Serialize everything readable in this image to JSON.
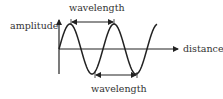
{
  "diagram": {
    "type": "wave-diagram",
    "labels": {
      "top_wavelength": "wavelength",
      "bottom_wavelength": "wavelength",
      "y_axis": "amplitude",
      "x_axis": "distance"
    },
    "colors": {
      "stroke": "#222222",
      "text": "#333333",
      "background": "#ffffff"
    },
    "wave": {
      "shape": "sine",
      "wavelength_px": 44,
      "amplitude_px": 25,
      "center_y": 49,
      "start_x": 59,
      "end_x": 157,
      "first_peak_x": 70
    },
    "annotations": [
      {
        "name": "top-wavelength-arrow",
        "from": "peak 1",
        "to": "peak 2"
      },
      {
        "name": "bottom-wavelength-arrow",
        "from": "trough 1",
        "to": "trough 2"
      }
    ]
  }
}
